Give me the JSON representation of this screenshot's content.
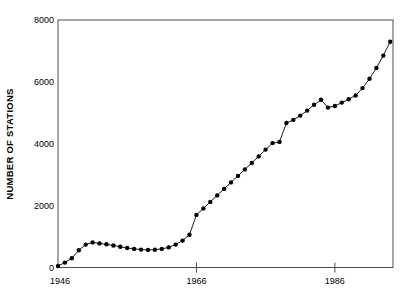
{
  "chart_data": {
    "type": "line",
    "title": "",
    "xlabel": "",
    "ylabel": "NUMBER OF STATIONS",
    "x": [
      1946,
      1947,
      1948,
      1949,
      1950,
      1951,
      1952,
      1953,
      1954,
      1955,
      1956,
      1957,
      1958,
      1959,
      1960,
      1961,
      1962,
      1963,
      1964,
      1965,
      1966,
      1967,
      1968,
      1969,
      1970,
      1971,
      1972,
      1973,
      1974,
      1975,
      1976,
      1977,
      1978,
      1979,
      1980,
      1981,
      1982,
      1983,
      1984,
      1985,
      1986,
      1987,
      1988,
      1989,
      1990,
      1991,
      1992,
      1993,
      1994
    ],
    "values": [
      50,
      160,
      300,
      560,
      740,
      810,
      780,
      750,
      710,
      670,
      630,
      600,
      580,
      570,
      575,
      600,
      650,
      740,
      870,
      1060,
      1700,
      1910,
      2120,
      2330,
      2540,
      2750,
      2960,
      3170,
      3380,
      3590,
      3810,
      4020,
      4060,
      4670,
      4770,
      4910,
      5070,
      5260,
      5420,
      5170,
      5220,
      5330,
      5440,
      5560,
      5800,
      6100,
      6450,
      6850,
      7300
    ],
    "xlim": [
      1946,
      1994.4
    ],
    "ylim": [
      0,
      8000
    ],
    "grid": false,
    "legend": null,
    "x_first_label": {
      "value": 1946,
      "label": "1946"
    },
    "xticks": [
      {
        "value": 1966,
        "label": "1966"
      },
      {
        "value": 1986,
        "label": "1986"
      }
    ],
    "yticks": [
      {
        "value": 0,
        "label": "0"
      },
      {
        "value": 2000,
        "label": "2000"
      },
      {
        "value": 4000,
        "label": "4000"
      },
      {
        "value": 6000,
        "label": "6000"
      },
      {
        "value": 8000,
        "label": "8000"
      }
    ],
    "colors": {
      "frame": "#4d4d4d",
      "line": "#000000",
      "marker": "#000000",
      "text": "#000000",
      "background": "#ffffff"
    },
    "marker_radius": 2.2
  }
}
